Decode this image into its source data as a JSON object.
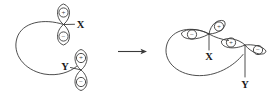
{
  "diagram": {
    "background_color": "#ffffff",
    "stroke_color": "#3a3a3a",
    "label_color": "#1a1a1a",
    "arrow": {
      "name": "reaction-arrow",
      "direction": "right",
      "label": ""
    },
    "structures": [
      {
        "id": "reactant",
        "side": "left",
        "atoms": [
          {
            "label": "X",
            "label_position": "right",
            "orbital": "p",
            "orientation": "vertical",
            "lobes": [
              {
                "position": "top",
                "sign": "+"
              },
              {
                "position": "bottom",
                "sign": "−"
              }
            ]
          },
          {
            "label": "Y",
            "label_position": "left",
            "orbital": "p",
            "orientation": "vertical",
            "lobes": [
              {
                "position": "top",
                "sign": "+"
              },
              {
                "position": "bottom",
                "sign": "−"
              }
            ]
          }
        ],
        "connector": "large open sigma loop joining X and Y"
      },
      {
        "id": "product",
        "side": "right",
        "atoms": [
          {
            "label": "X",
            "label_position": "below",
            "orbital": "p",
            "orientation": "tilted",
            "lobes": [
              {
                "position": "upper-right",
                "sign": "+"
              },
              {
                "position": "left",
                "sign": "−"
              }
            ]
          },
          {
            "label": "Y",
            "label_position": "below",
            "orbital": "p",
            "orientation": "tilted",
            "lobes": [
              {
                "position": "upper-left",
                "sign": "+"
              },
              {
                "position": "right",
                "sign": "−"
              }
            ]
          }
        ],
        "connector": "large open sigma loop joining X and Y with bonding overlap"
      }
    ],
    "signs": {
      "plus": "+",
      "minus": "−"
    },
    "labels": {
      "x": "X",
      "y": "Y"
    }
  }
}
